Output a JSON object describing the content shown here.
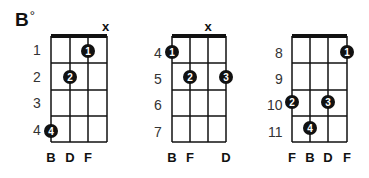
{
  "title": {
    "root": "B",
    "symbol": "°"
  },
  "colors": {
    "ink": "#111111",
    "background": "#ffffff",
    "dot_text": "#ffffff"
  },
  "diagrams": [
    {
      "id": "position-1",
      "fret_labels": [
        "1",
        "2",
        "3",
        "4"
      ],
      "string_labels": [
        "B",
        "D",
        "F",
        ""
      ],
      "muted": [
        "",
        "",
        "",
        "x"
      ],
      "fingers": [
        {
          "finger": "1",
          "string": 3,
          "fret": 1
        },
        {
          "finger": "2",
          "string": 2,
          "fret": 2
        },
        {
          "finger": "4",
          "string": 1,
          "fret": 4
        }
      ]
    },
    {
      "id": "position-2",
      "fret_labels": [
        "4",
        "5",
        "6",
        "7"
      ],
      "string_labels": [
        "B",
        "F",
        "",
        "D"
      ],
      "muted": [
        "",
        "",
        "x",
        ""
      ],
      "fingers": [
        {
          "finger": "1",
          "string": 1,
          "fret": 1
        },
        {
          "finger": "2",
          "string": 2,
          "fret": 2
        },
        {
          "finger": "3",
          "string": 4,
          "fret": 2
        }
      ]
    },
    {
      "id": "position-3",
      "fret_labels": [
        "8",
        "9",
        "10",
        "11"
      ],
      "string_labels": [
        "F",
        "B",
        "D",
        "F"
      ],
      "muted": [
        "",
        "",
        "",
        ""
      ],
      "fingers": [
        {
          "finger": "1",
          "string": 4,
          "fret": 1
        },
        {
          "finger": "2",
          "string": 1,
          "fret": 3
        },
        {
          "finger": "3",
          "string": 3,
          "fret": 3
        },
        {
          "finger": "4",
          "string": 2,
          "fret": 4
        }
      ]
    }
  ]
}
